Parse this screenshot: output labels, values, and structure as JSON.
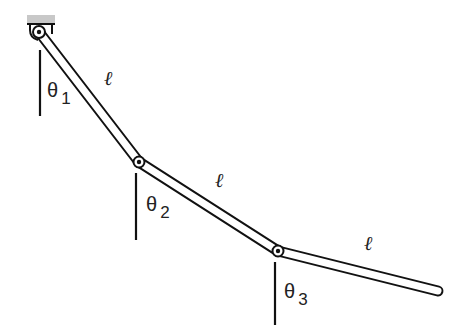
{
  "colors": {
    "stroke": "#111111",
    "mount": "#c8c8c8",
    "background": "#ffffff"
  },
  "mount": {
    "x": 27,
    "y": 15,
    "w": 28,
    "h": 9
  },
  "joints": [
    {
      "x": 39,
      "y": 32
    },
    {
      "x": 139,
      "y": 162
    },
    {
      "x": 278,
      "y": 251
    },
    {
      "x": 438,
      "y": 291
    }
  ],
  "rod_width": 9,
  "links": [
    {
      "label": "ℓ",
      "label_x": 104,
      "label_y": 68
    },
    {
      "label": "ℓ",
      "label_x": 215,
      "label_y": 170
    },
    {
      "label": "ℓ",
      "label_x": 364,
      "label_y": 233
    }
  ],
  "angles": [
    {
      "symbol": "θ",
      "index": "1",
      "ref_x": 40,
      "ref_y1": 50,
      "ref_y2": 116,
      "label_x": 47,
      "label_y": 80
    },
    {
      "symbol": "θ",
      "index": "2",
      "ref_x": 136,
      "ref_y1": 173,
      "ref_y2": 240,
      "label_x": 146,
      "label_y": 194
    },
    {
      "symbol": "θ",
      "index": "3",
      "ref_x": 275,
      "ref_y1": 262,
      "ref_y2": 325,
      "label_x": 284,
      "label_y": 281
    }
  ]
}
